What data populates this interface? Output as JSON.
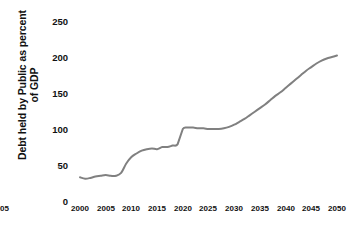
{
  "chart_data": {
    "type": "line",
    "title": "",
    "xlabel": "",
    "ylabel": "Debt held by Public as percent of GDP",
    "ylabel_lines": [
      "Debt held by Public as percent",
      "of GDP"
    ],
    "xlim": [
      2000,
      2050
    ],
    "ylim": [
      0,
      250
    ],
    "grid": false,
    "legend": "none",
    "line_color": "#808080",
    "background_color": "#ffffff",
    "text_color": "#111111",
    "x_ticks": [
      2000,
      2005,
      2010,
      2015,
      2020,
      2025,
      2030,
      2035,
      2040,
      2045,
      2050
    ],
    "x_tick_labels": [
      "2000",
      "2005",
      "2010",
      "2015",
      "2020",
      "2025",
      "2030",
      "2035",
      "2040",
      "2045",
      "2050"
    ],
    "y_ticks": [
      0,
      50,
      100,
      150,
      200,
      250
    ],
    "y_tick_labels": [
      "0",
      "50",
      "100",
      "150",
      "200",
      "250"
    ],
    "series": [
      {
        "name": "Debt held by Public as percent of GDP",
        "x": [
          2000,
          2001,
          2002,
          2003,
          2004,
          2005,
          2006,
          2007,
          2008,
          2009,
          2010,
          2011,
          2012,
          2013,
          2014,
          2015,
          2016,
          2017,
          2018,
          2019,
          2020,
          2021,
          2022,
          2023,
          2024,
          2025,
          2026,
          2027,
          2028,
          2029,
          2030,
          2031,
          2032,
          2033,
          2034,
          2035,
          2036,
          2037,
          2038,
          2039,
          2040,
          2041,
          2042,
          2043,
          2044,
          2045,
          2046,
          2047,
          2048,
          2049,
          2050
        ],
        "values": [
          33,
          31,
          32,
          34,
          35,
          36,
          35,
          35,
          39,
          52,
          61,
          66,
          70,
          72,
          73,
          72,
          75,
          75,
          77,
          79,
          100,
          102,
          102,
          101,
          101,
          100,
          100,
          100,
          101,
          103,
          106,
          110,
          114,
          119,
          124,
          129,
          134,
          140,
          146,
          151,
          157,
          163,
          169,
          175,
          181,
          186,
          191,
          195,
          198,
          200,
          202
        ]
      }
    ]
  }
}
